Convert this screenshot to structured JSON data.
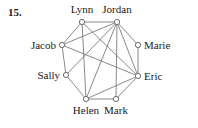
{
  "problem": {
    "number": "15."
  },
  "graph": {
    "type": "undirected-graph",
    "stroke_color": "#6b6b6b",
    "label_color": "#1a1a1a",
    "node_fill": "#ffffff",
    "node_radius": 2.6,
    "vertices": [
      {
        "id": "lynn",
        "label": "Lynn",
        "x": 82,
        "y": 22,
        "label_x": 82,
        "label_y": 13,
        "anchor": "middle"
      },
      {
        "id": "jordan",
        "label": "Jordan",
        "x": 117,
        "y": 22,
        "label_x": 117,
        "label_y": 13,
        "anchor": "middle"
      },
      {
        "id": "marie",
        "label": "Marie",
        "x": 138,
        "y": 45,
        "label_x": 144,
        "label_y": 49,
        "anchor": "start"
      },
      {
        "id": "eric",
        "label": "Eric",
        "x": 138,
        "y": 76,
        "label_x": 144,
        "label_y": 80,
        "anchor": "start"
      },
      {
        "id": "mark",
        "label": "Mark",
        "x": 116,
        "y": 99,
        "label_x": 116,
        "label_y": 114,
        "anchor": "middle"
      },
      {
        "id": "helen",
        "label": "Helen",
        "x": 86,
        "y": 99,
        "label_x": 86,
        "label_y": 114,
        "anchor": "middle"
      },
      {
        "id": "sally",
        "label": "Sally",
        "x": 66,
        "y": 75,
        "label_x": 60,
        "label_y": 79,
        "anchor": "end"
      },
      {
        "id": "jacob",
        "label": "Jacob",
        "x": 62,
        "y": 45,
        "label_x": 56,
        "label_y": 49,
        "anchor": "end"
      }
    ],
    "edges": [
      {
        "from": "lynn",
        "to": "jordan"
      },
      {
        "from": "jordan",
        "to": "marie"
      },
      {
        "from": "marie",
        "to": "eric"
      },
      {
        "from": "eric",
        "to": "mark"
      },
      {
        "from": "mark",
        "to": "helen"
      },
      {
        "from": "helen",
        "to": "sally"
      },
      {
        "from": "sally",
        "to": "jacob"
      },
      {
        "from": "jacob",
        "to": "lynn"
      },
      {
        "from": "lynn",
        "to": "helen"
      },
      {
        "from": "lynn",
        "to": "eric"
      },
      {
        "from": "jordan",
        "to": "helen"
      },
      {
        "from": "jordan",
        "to": "mark"
      },
      {
        "from": "jordan",
        "to": "sally"
      },
      {
        "from": "jordan",
        "to": "jacob"
      },
      {
        "from": "jordan",
        "to": "eric"
      },
      {
        "from": "jacob",
        "to": "eric"
      },
      {
        "from": "helen",
        "to": "eric"
      }
    ]
  }
}
